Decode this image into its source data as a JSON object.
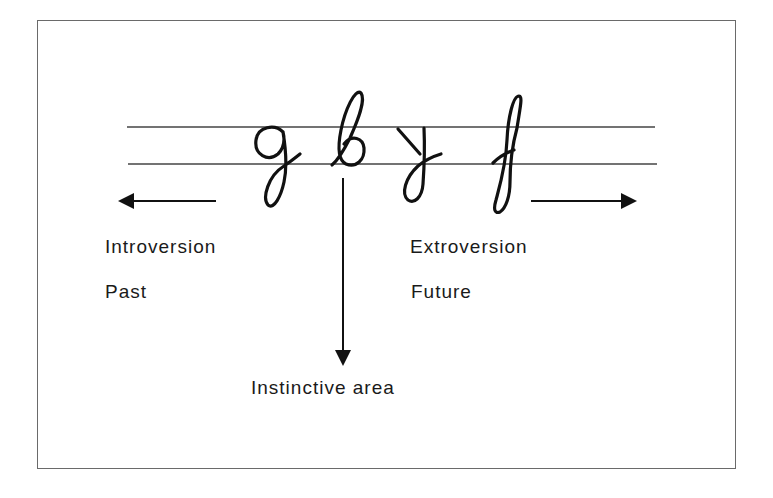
{
  "diagram": {
    "letters": [
      "g",
      "b",
      "y",
      "f"
    ],
    "labels": {
      "left_top": "Introversion",
      "left_bottom": "Past",
      "right_top": "Extroversion",
      "right_bottom": "Future",
      "bottom": "Instinctive area"
    },
    "arrows": {
      "left": "introversion-past-direction",
      "right": "extroversion-future-direction",
      "down": "instinctive-area-direction"
    },
    "colors": {
      "ink": "#111111",
      "frame": "#6a6a6a",
      "guideline": "#444444"
    }
  }
}
